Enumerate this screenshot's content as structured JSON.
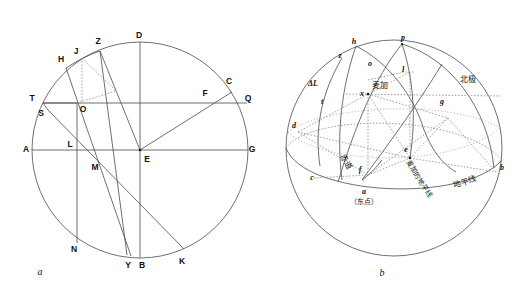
{
  "figure": {
    "caption_a": "a",
    "caption_b": "b"
  },
  "diagram_a": {
    "name": "celestial-sphere-plane-construction",
    "labels": {
      "A": "A",
      "B": "B",
      "C": "C",
      "D": "D",
      "E": "E",
      "F": "F",
      "G": "G",
      "H": "H",
      "J": "J",
      "K": "K",
      "L": "L",
      "M": "M",
      "N": "N",
      "O": "O",
      "Q": "Q",
      "S": "S",
      "T": "T",
      "Y": "Y",
      "Z": "Z"
    }
  },
  "diagram_b": {
    "name": "terrestrial-globe-mecca-qibla",
    "labels": {
      "a": "a",
      "b": "b",
      "c": "c",
      "d": "d",
      "e": "e",
      "f": "f",
      "g": "g",
      "h": "h",
      "l": "l",
      "o": "o",
      "p": "p",
      "t": "t",
      "x": "x",
      "z": "z",
      "delta_l": "ΔL"
    },
    "annotations": {
      "mecca": "麦加",
      "north_pole": "北极",
      "equator": "赤道",
      "horizon": "地平线",
      "mecca_horizon": "麦加的地平线",
      "east_point": "（东点）"
    }
  },
  "colors": {
    "line": "#4a4a4a",
    "dotted": "#8d8d8d",
    "text": "#111111",
    "background": "#ffffff"
  }
}
